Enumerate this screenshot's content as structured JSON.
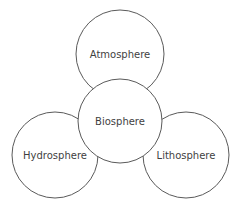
{
  "diagram": {
    "type": "overlapping-circles",
    "colors": {
      "stroke": "#5a5a5a",
      "fill": "#ffffff",
      "text": "#3f3f3f",
      "background": "#ffffff"
    },
    "nodes": [
      {
        "id": "atmosphere",
        "label": "Atmosphere",
        "cx": 120,
        "cy": 54,
        "r": 44
      },
      {
        "id": "hydrosphere",
        "label": "Hydrosphere",
        "cx": 55,
        "cy": 155,
        "r": 43
      },
      {
        "id": "lithosphere",
        "label": "Lithosphere",
        "cx": 186,
        "cy": 155,
        "r": 43
      },
      {
        "id": "biosphere",
        "label": "Biosphere",
        "cx": 120,
        "cy": 121,
        "r": 42
      }
    ],
    "labels": {
      "atmosphere": "Atmosphere",
      "hydrosphere": "Hydrosphere",
      "lithosphere": "Lithosphere",
      "biosphere": "Biosphere"
    }
  }
}
